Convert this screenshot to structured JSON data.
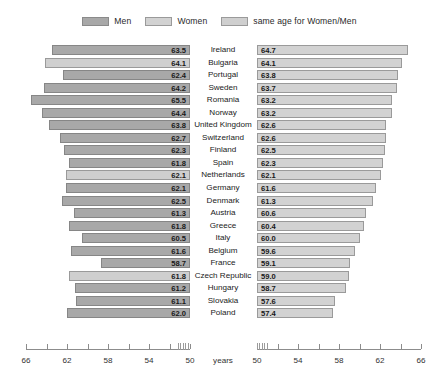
{
  "legend": {
    "items": [
      {
        "label": "Men",
        "key": "men",
        "color": "#a8a8a8"
      },
      {
        "label": "Women",
        "key": "women",
        "color": "#d2d2d2"
      },
      {
        "label": "same age for Women/Men",
        "key": "same",
        "color": "#cfcfcf"
      }
    ]
  },
  "axis": {
    "unit_label": "years",
    "left_labels": [
      "66",
      "62",
      "58",
      "54",
      "50"
    ],
    "right_labels": [
      "50",
      "54",
      "58",
      "62",
      "66"
    ],
    "left_min": 50,
    "left_max": 66,
    "right_min": 50,
    "right_max": 66,
    "tick_step": 2,
    "label_step": 4,
    "has_break": true
  },
  "chart_data": {
    "type": "bar",
    "title": "",
    "subtitle": "",
    "xlabel": "years",
    "ylabel": "",
    "orientation": "horizontal",
    "layout": "diverging-butterfly",
    "grid": false,
    "legend_position": "top-center",
    "xlim_left": [
      50,
      66
    ],
    "xlim_right": [
      50,
      66
    ],
    "left_axis_direction": "reversed",
    "categories": [
      "Ireland",
      "Bulgaria",
      "Portugal",
      "Sweden",
      "Romania",
      "Norway",
      "United Kingdom",
      "Switzerland",
      "Finland",
      "Spain",
      "Netherlands",
      "Germany",
      "Denmark",
      "Austria",
      "Greece",
      "Italy",
      "Belgium",
      "France",
      "Czech Republic",
      "Hungary",
      "Slovakia",
      "Poland"
    ],
    "series": [
      {
        "name": "Men",
        "side": "left",
        "values": [
          63.5,
          64.1,
          62.4,
          64.2,
          65.5,
          64.4,
          63.8,
          62.7,
          62.3,
          61.8,
          62.1,
          62.1,
          62.5,
          61.3,
          61.8,
          60.5,
          61.6,
          58.7,
          61.8,
          61.2,
          61.1,
          62.0
        ]
      },
      {
        "name": "Women",
        "side": "right",
        "values": [
          64.7,
          64.1,
          63.8,
          63.7,
          63.2,
          63.2,
          62.6,
          62.6,
          62.5,
          62.3,
          62.1,
          61.6,
          61.3,
          60.6,
          60.4,
          60.0,
          59.6,
          59.1,
          59.0,
          58.7,
          57.6,
          57.4
        ]
      }
    ],
    "same_age_flags": [
      false,
      true,
      false,
      false,
      false,
      false,
      false,
      false,
      false,
      false,
      true,
      false,
      false,
      false,
      false,
      false,
      false,
      false,
      true,
      false,
      false,
      false
    ]
  },
  "rows": [
    {
      "country": "Ireland",
      "men": "63.5",
      "women": "64.7",
      "same": false
    },
    {
      "country": "Bulgaria",
      "men": "64.1",
      "women": "64.1",
      "same": true
    },
    {
      "country": "Portugal",
      "men": "62.4",
      "women": "63.8",
      "same": false
    },
    {
      "country": "Sweden",
      "men": "64.2",
      "women": "63.7",
      "same": false
    },
    {
      "country": "Romania",
      "men": "65.5",
      "women": "63.2",
      "same": false
    },
    {
      "country": "Norway",
      "men": "64.4",
      "women": "63.2",
      "same": false
    },
    {
      "country": "United Kingdom",
      "men": "63.8",
      "women": "62.6",
      "same": false
    },
    {
      "country": "Switzerland",
      "men": "62.7",
      "women": "62.6",
      "same": false
    },
    {
      "country": "Finland",
      "men": "62.3",
      "women": "62.5",
      "same": false
    },
    {
      "country": "Spain",
      "men": "61.8",
      "women": "62.3",
      "same": false
    },
    {
      "country": "Netherlands",
      "men": "62.1",
      "women": "62.1",
      "same": true
    },
    {
      "country": "Germany",
      "men": "62.1",
      "women": "61.6",
      "same": false
    },
    {
      "country": "Denmark",
      "men": "62.5",
      "women": "61.3",
      "same": false
    },
    {
      "country": "Austria",
      "men": "61.3",
      "women": "60.6",
      "same": false
    },
    {
      "country": "Greece",
      "men": "61.8",
      "women": "60.4",
      "same": false
    },
    {
      "country": "Italy",
      "men": "60.5",
      "women": "60.0",
      "same": false
    },
    {
      "country": "Belgium",
      "men": "61.6",
      "women": "59.6",
      "same": false
    },
    {
      "country": "France",
      "men": "58.7",
      "women": "59.1",
      "same": false
    },
    {
      "country": "Czech Republic",
      "men": "61.8",
      "women": "59.0",
      "same": true
    },
    {
      "country": "Hungary",
      "men": "61.2",
      "women": "58.7",
      "same": false
    },
    {
      "country": "Slovakia",
      "men": "61.1",
      "women": "57.6",
      "same": false
    },
    {
      "country": "Poland",
      "men": "62.0",
      "women": "57.4",
      "same": false
    }
  ]
}
